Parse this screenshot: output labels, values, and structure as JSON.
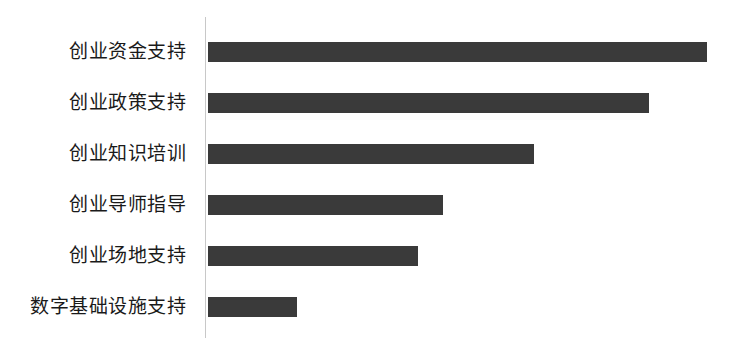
{
  "chart_data": {
    "type": "bar",
    "orientation": "horizontal",
    "title": "",
    "subtitle": "",
    "xlabel": "",
    "ylabel": "",
    "legend": [],
    "legend_position": "none",
    "grid": false,
    "axis_ticks_visible": false,
    "value_labels_visible": false,
    "xlim": [
      0,
      110
    ],
    "categories": [
      "创业资金支持",
      "创业政策支持",
      "创业知识培训",
      "创业导师指导",
      "创业场地支持",
      "数字基础设施支持"
    ],
    "values": [
      100,
      88,
      65,
      47,
      42,
      18
    ],
    "bar_pixel_lengths": [
      499,
      441,
      326,
      235,
      210,
      89
    ],
    "colors": {
      "bar": "#3a3a3a",
      "axis_line": "#c8c8c8",
      "background": "#ffffff",
      "label_text": "#1a1a1a"
    }
  }
}
